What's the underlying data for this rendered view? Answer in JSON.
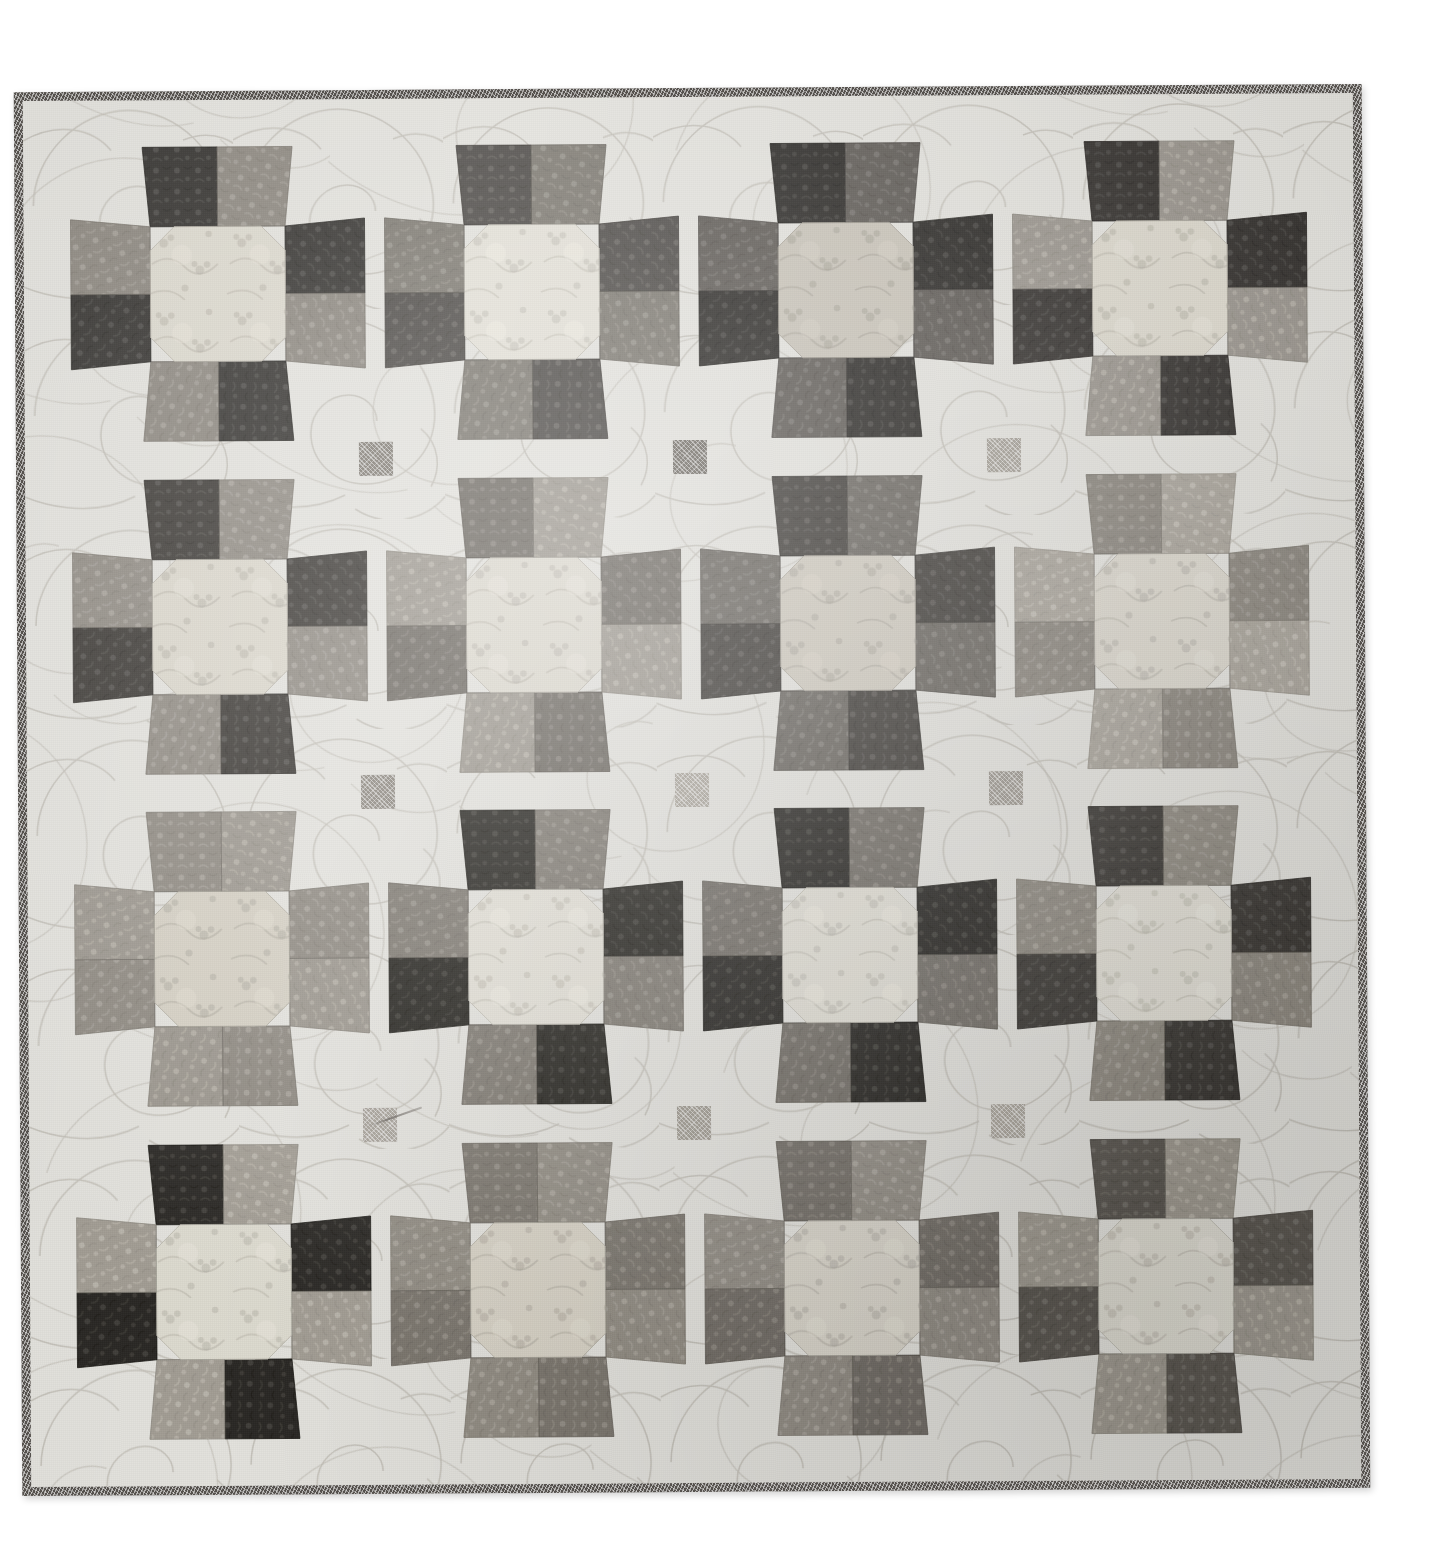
{
  "scene": {
    "subject": "patchwork quilt photograph",
    "canvas_background": "#ffffff",
    "quilt": {
      "layout": "4 rows x 4 columns of eight-pointed sawtooth star blocks on light background with small square cornerstones",
      "rows": 4,
      "columns": 4,
      "background_fabric_color": "#e3e2dd",
      "binding_color": "#55514d",
      "binding_width_px": 9,
      "shadow": "soft drop shadow lower-right"
    }
  },
  "palette": {
    "background_light": "#e3e2dd",
    "background_light_alt": "#dedcd6",
    "binding_dark": "#55514d",
    "cornerstone_dark": "#7e7a73",
    "cornerstone_mid": "#9a958d",
    "very_dark": "#2c2a28",
    "dark": "#3b3936",
    "dark_warm": "#4a4642",
    "mid_dark": "#6d6963",
    "mid": "#8a857d",
    "mid_light": "#a6a199",
    "light": "#c2bdb4",
    "center_cream": "#ddd9cf",
    "center_pale": "#e6e2d9"
  },
  "blocks": [
    {
      "id": "block-r1c1",
      "row": 1,
      "col": 1,
      "center_fabric": "pale cream tonal with faint medallion flowers",
      "center_color": "#dcd8cd",
      "point_colors": [
        "#33312e",
        "#8b867e",
        "#33312e",
        "#8b867e",
        "#33312e",
        "#8b867e",
        "#33312e",
        "#8b867e"
      ],
      "point_fabrics": [
        "dark berry vine print",
        "grey dotted tonal",
        "dark berry vine print",
        "grey dotted tonal",
        "dark berry vine print",
        "grey dotted tonal",
        "dark berry vine print",
        "grey dotted tonal"
      ]
    },
    {
      "id": "block-r1c2",
      "row": 1,
      "col": 2,
      "center_fabric": "ivory with scattered small flower clusters",
      "center_color": "#e3e0d6",
      "point_colors": [
        "#4d4a46",
        "#7d7971",
        "#4d4a46",
        "#7d7971",
        "#4d4a46",
        "#7d7971",
        "#4d4a46",
        "#7d7971"
      ],
      "point_fabrics": [
        "charcoal pin-dot",
        "medium grey pin-dot",
        "charcoal pin-dot",
        "medium grey pin-dot",
        "charcoal pin-dot",
        "medium grey pin-dot",
        "charcoal pin-dot",
        "medium grey pin-dot"
      ]
    },
    {
      "id": "block-r1c3",
      "row": 1,
      "col": 3,
      "center_fabric": "light floral bouquet toile",
      "center_color": "#c8c3b8",
      "point_colors": [
        "#2b2926",
        "#5e5a55",
        "#2b2926",
        "#5e5a55",
        "#2b2926",
        "#5e5a55",
        "#2b2926",
        "#5e5a55"
      ],
      "point_fabrics": [
        "black fern leaf print",
        "dark grey packed floral",
        "black fern leaf print",
        "dark grey packed floral",
        "black fern leaf print",
        "dark grey packed floral",
        "black fern leaf print",
        "dark grey packed floral"
      ]
    },
    {
      "id": "block-r1c4",
      "row": 1,
      "col": 4,
      "center_fabric": "pale cream medallion tonal",
      "center_color": "#dbd7cc",
      "point_colors": [
        "#35322f",
        "#9a958d",
        "#35322f",
        "#9a958d",
        "#35322f",
        "#9a958d",
        "#35322f",
        "#9a958d"
      ],
      "point_fabrics": [
        "dark berry vine print",
        "light grey solid-ish tonal",
        "dark berry vine print",
        "light grey solid-ish tonal",
        "dark berry vine print",
        "light grey solid-ish tonal",
        "dark berry vine print",
        "light grey solid-ish tonal"
      ]
    },
    {
      "id": "block-r2c1",
      "row": 2,
      "col": 1,
      "center_fabric": "cream with grey fern sprigs",
      "center_color": "#dad6cb",
      "point_colors": [
        "#3a3733",
        "#8f8a82",
        "#3a3733",
        "#8f8a82",
        "#3a3733",
        "#8f8a82",
        "#3a3733",
        "#8f8a82"
      ],
      "point_fabrics": [
        "dark berry vine print",
        "medium grey tonal",
        "dark berry vine print",
        "medium grey tonal",
        "dark berry vine print",
        "medium grey tonal",
        "dark berry vine print",
        "medium grey tonal"
      ]
    },
    {
      "id": "block-r2c2",
      "row": 2,
      "col": 2,
      "center_fabric": "cream with grey fern sprigs",
      "center_color": "#dcd8ce",
      "point_colors": [
        "#6f6a63",
        "#9d988f",
        "#6f6a63",
        "#9d988f",
        "#6f6a63",
        "#9d988f",
        "#6f6a63",
        "#9d988f"
      ],
      "point_fabrics": [
        "grey ditsy floral",
        "pale grey packed print",
        "grey ditsy floral",
        "pale grey packed print",
        "grey ditsy floral",
        "pale grey packed print",
        "grey ditsy floral",
        "pale grey packed print"
      ]
    },
    {
      "id": "block-r2c3",
      "row": 2,
      "col": 3,
      "center_fabric": "light grey floral spray print",
      "center_color": "#cfcabf",
      "point_colors": [
        "#403d39",
        "#6a6660",
        "#403d39",
        "#6a6660",
        "#403d39",
        "#6a6660",
        "#403d39",
        "#6a6660"
      ],
      "point_fabrics": [
        "charcoal solid tonal",
        "dark grey packed floral",
        "charcoal solid tonal",
        "dark grey packed floral",
        "charcoal solid tonal",
        "dark grey packed floral",
        "charcoal solid tonal",
        "dark grey packed floral"
      ]
    },
    {
      "id": "block-r2c4",
      "row": 2,
      "col": 4,
      "center_fabric": "cream with grey fern sprigs",
      "center_color": "#d9d5cb",
      "point_colors": [
        "#8a857d",
        "#a8a39a",
        "#8a857d",
        "#a8a39a",
        "#8a857d",
        "#a8a39a",
        "#8a857d",
        "#a8a39a"
      ],
      "point_fabrics": [
        "grey ditsy floral",
        "pale grey lace print",
        "grey ditsy floral",
        "pale grey lace print",
        "grey ditsy floral",
        "pale grey lace print",
        "grey ditsy floral",
        "pale grey lace print"
      ]
    },
    {
      "id": "block-r3c1",
      "row": 3,
      "col": 1,
      "center_fabric": "large cabbage-rose bouquet print",
      "center_color": "#d4cfc3",
      "point_colors": [
        "#8e8981",
        "#9b968d",
        "#8e8981",
        "#9b968d",
        "#8e8981",
        "#9b968d",
        "#8e8981",
        "#9b968d"
      ],
      "point_fabrics": [
        "grey leafy outline print",
        "grey floral outline print",
        "grey leafy outline print",
        "grey floral outline print",
        "grey leafy outline print",
        "grey floral outline print",
        "grey leafy outline print",
        "grey floral outline print"
      ]
    },
    {
      "id": "block-r3c2",
      "row": 3,
      "col": 2,
      "center_fabric": "ivory with scattered flower clusters",
      "center_color": "#e2dfd5",
      "point_colors": [
        "#26241f",
        "#7f7a72",
        "#26241f",
        "#7f7a72",
        "#26241f",
        "#7f7a72",
        "#26241f",
        "#7f7a72"
      ],
      "point_fabrics": [
        "black fern leaf print",
        "grey rose print",
        "black fern leaf print",
        "grey rose print",
        "black fern leaf print",
        "grey rose print",
        "black fern leaf print",
        "grey rose print"
      ]
    },
    {
      "id": "block-r3c3",
      "row": 3,
      "col": 3,
      "center_fabric": "ivory with scattered flower clusters",
      "center_color": "#e0ddd3",
      "point_colors": [
        "#272521",
        "#726d66",
        "#272521",
        "#726d66",
        "#272521",
        "#726d66",
        "#272521",
        "#726d66"
      ],
      "point_fabrics": [
        "black fern leaf print",
        "grey packed medallion print",
        "black fern leaf print",
        "grey packed medallion print",
        "black fern leaf print",
        "grey packed medallion print",
        "black fern leaf print",
        "grey packed medallion print"
      ]
    },
    {
      "id": "block-r3c4",
      "row": 3,
      "col": 4,
      "center_fabric": "ivory with scattered flower clusters",
      "center_color": "#e1ded4",
      "point_colors": [
        "#3a3733",
        "#8d887f",
        "#3a3733",
        "#8d887f",
        "#3a3733",
        "#8d887f",
        "#3a3733",
        "#8d887f"
      ],
      "point_fabrics": [
        "dark floral print",
        "grey leafy outline print",
        "dark floral print",
        "grey leafy outline print",
        "dark floral print",
        "grey leafy outline print",
        "dark floral print",
        "grey leafy outline print"
      ]
    },
    {
      "id": "block-r4c1",
      "row": 4,
      "col": 1,
      "center_fabric": "pale cream medallion tonal",
      "center_color": "#dddacf",
      "point_colors": [
        "#2a2824",
        "#a29d94",
        "#2a2824",
        "#a29d94",
        "#2a2824",
        "#a29d94",
        "#2a2824",
        "#a29d94"
      ],
      "point_fabrics": [
        "black fern leaf print",
        "pale grey medallion print",
        "black fern leaf print",
        "pale grey medallion print",
        "black fern leaf print",
        "pale grey medallion print",
        "black fern leaf print",
        "pale grey medallion print"
      ]
    },
    {
      "id": "block-r4c2",
      "row": 4,
      "col": 2,
      "center_fabric": "large cabbage-rose bouquet print",
      "center_color": "#d6d1c5",
      "point_colors": [
        "#7c776f",
        "#918c83",
        "#7c776f",
        "#918c83",
        "#7c776f",
        "#918c83",
        "#7c776f",
        "#918c83"
      ],
      "point_fabrics": [
        "grey ditsy floral",
        "medium grey tonal",
        "grey ditsy floral",
        "medium grey tonal",
        "grey ditsy floral",
        "medium grey tonal",
        "grey ditsy floral",
        "medium grey tonal"
      ]
    },
    {
      "id": "block-r4c3",
      "row": 4,
      "col": 3,
      "center_fabric": "cream with grey fern sprigs",
      "center_color": "#d8d4ca",
      "point_colors": [
        "#736e67",
        "#918c84",
        "#736e67",
        "#918c84",
        "#736e67",
        "#918c84",
        "#736e67",
        "#918c84"
      ],
      "point_fabrics": [
        "grey ditsy floral",
        "medium grey tonal",
        "grey ditsy floral",
        "medium grey tonal",
        "grey ditsy floral",
        "medium grey tonal",
        "grey ditsy floral",
        "medium grey tonal"
      ]
    },
    {
      "id": "block-r4c4",
      "row": 4,
      "col": 4,
      "center_fabric": "pale cream medallion tonal",
      "center_color": "#dedbd1",
      "point_colors": [
        "#5b5751",
        "#9e998f",
        "#5b5751",
        "#9e998f",
        "#5b5751",
        "#9e998f",
        "#5b5751",
        "#9e998f"
      ],
      "point_fabrics": [
        "dark grey stripe tonal",
        "grey blossom print",
        "dark grey stripe tonal",
        "grey blossom print",
        "dark grey stripe tonal",
        "grey blossom print",
        "dark grey stripe tonal",
        "grey blossom print"
      ]
    }
  ],
  "cornerstones": [
    {
      "id": "cornerstone-1",
      "row": 1,
      "col": 1,
      "color": "#7f7a72"
    },
    {
      "id": "cornerstone-2",
      "row": 1,
      "col": 2,
      "color": "#6f6a63"
    },
    {
      "id": "cornerstone-3",
      "row": 1,
      "col": 3,
      "color": "#a29d94"
    },
    {
      "id": "cornerstone-4",
      "row": 2,
      "col": 1,
      "color": "#8a857d"
    },
    {
      "id": "cornerstone-5",
      "row": 2,
      "col": 2,
      "color": "#aaa59c"
    },
    {
      "id": "cornerstone-6",
      "row": 2,
      "col": 3,
      "color": "#9b968d"
    },
    {
      "id": "cornerstone-7",
      "row": 3,
      "col": 1,
      "color": "#a6a199"
    },
    {
      "id": "cornerstone-8",
      "row": 3,
      "col": 2,
      "color": "#9e998f"
    },
    {
      "id": "cornerstone-9",
      "row": 3,
      "col": 3,
      "color": "#a8a39a"
    }
  ],
  "details": {
    "stray_thread": "loose light thread lying across the quilt near the lower-left cornerstone"
  }
}
